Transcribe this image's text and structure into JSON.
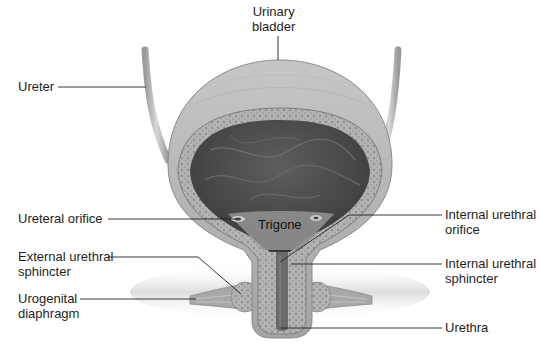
{
  "figure": {
    "colors": {
      "background": "#ffffff",
      "wall_outer": "#a9a9a9",
      "wall_light": "#cfcfcf",
      "lumen_dark": "#4a4a4a",
      "trigone": "#8c8c8c",
      "leader_line": "#222222",
      "label_text": "#1e1e1e"
    }
  },
  "labels": {
    "urinary_bladder": "Urinary\nbladder",
    "ureter": "Ureter",
    "ureteral_orifice": "Ureteral orifice",
    "trigone": "Trigone",
    "external_urethral_sphincter": "External urethral\nsphincter",
    "urogenital_diaphragm": "Urogenital\ndiaphragm",
    "internal_urethral_orifice": "Internal urethral\norifice",
    "internal_urethral_sphincter": "Internal urethral\nsphincter",
    "urethra": "Urethra"
  }
}
